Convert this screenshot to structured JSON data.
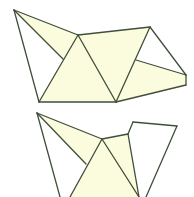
{
  "diagram": {
    "title": "",
    "colors": {
      "fill": "#fbfbdd",
      "stroke": "#3f4f3a",
      "background": "#ffffff"
    },
    "stroke_width": 1.3,
    "figures": [
      {
        "name": "unfolded-net-top",
        "filled_faces": [
          [
            [
              14,
              10
            ],
            [
              78,
              35
            ],
            [
              63,
              59
            ]
          ],
          [
            [
              78,
              35
            ],
            [
              39,
              102
            ],
            [
              116,
              102
            ]
          ],
          [
            [
              78,
              35
            ],
            [
              150,
              27
            ],
            [
              116,
              102
            ]
          ],
          [
            [
              136,
              60
            ],
            [
              186,
              75
            ],
            [
              186,
              85
            ],
            [
              116,
              102
            ]
          ]
        ],
        "edges": [
          [
            [
              14,
              10
            ],
            [
              78,
              35
            ]
          ],
          [
            [
              14,
              10
            ],
            [
              63,
              59
            ]
          ],
          [
            [
              14,
              10
            ],
            [
              39,
              102
            ]
          ],
          [
            [
              78,
              35
            ],
            [
              150,
              27
            ]
          ],
          [
            [
              78,
              35
            ],
            [
              39,
              102
            ]
          ],
          [
            [
              78,
              35
            ],
            [
              116,
              102
            ]
          ],
          [
            [
              39,
              102
            ],
            [
              116,
              102
            ]
          ],
          [
            [
              150,
              27
            ],
            [
              116,
              102
            ]
          ],
          [
            [
              150,
              27
            ],
            [
              186,
              75
            ]
          ],
          [
            [
              136,
              60
            ],
            [
              186,
              75
            ]
          ],
          [
            [
              186,
              75
            ],
            [
              186,
              85
            ]
          ],
          [
            [
              186,
              85
            ],
            [
              116,
              102
            ]
          ]
        ]
      },
      {
        "name": "unfolded-net-bottom",
        "filled_faces": [
          [
            [
              37,
              113
            ],
            [
              102,
              139
            ],
            [
              86,
              164
            ]
          ],
          [
            [
              102,
              139
            ],
            [
              70,
              197
            ],
            [
              139,
              197
            ]
          ],
          [
            [
              102,
              139
            ],
            [
              128,
              134
            ],
            [
              139,
              197
            ]
          ]
        ],
        "edges": [
          [
            [
              37,
              113
            ],
            [
              102,
              139
            ]
          ],
          [
            [
              37,
              113
            ],
            [
              86,
              164
            ]
          ],
          [
            [
              37,
              113
            ],
            [
              60,
              197
            ]
          ],
          [
            [
              102,
              139
            ],
            [
              128,
              134
            ]
          ],
          [
            [
              102,
              139
            ],
            [
              70,
              197
            ]
          ],
          [
            [
              102,
              139
            ],
            [
              139,
              197
            ]
          ],
          [
            [
              128,
              134
            ],
            [
              133,
              122
            ]
          ],
          [
            [
              133,
              122
            ],
            [
              177,
              126
            ]
          ],
          [
            [
              128,
              134
            ],
            [
              139,
              197
            ]
          ],
          [
            [
              177,
              126
            ],
            [
              146,
              197
            ]
          ]
        ]
      }
    ]
  }
}
